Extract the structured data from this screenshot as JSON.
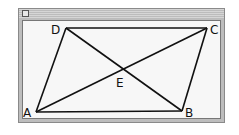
{
  "window": {
    "title": ""
  },
  "diagram": {
    "shape": "parallelogram",
    "vertices": {
      "A": {
        "label": "A",
        "x": 36,
        "y": 112
      },
      "B": {
        "label": "B",
        "x": 182,
        "y": 111
      },
      "C": {
        "label": "C",
        "x": 207,
        "y": 28
      },
      "D": {
        "label": "D",
        "x": 66,
        "y": 28
      }
    },
    "intersection": {
      "label": "E",
      "x": 121,
      "y": 69
    },
    "edges": [
      [
        "A",
        "B"
      ],
      [
        "B",
        "C"
      ],
      [
        "C",
        "D"
      ],
      [
        "D",
        "A"
      ]
    ],
    "diagonals": [
      [
        "A",
        "C"
      ],
      [
        "B",
        "D"
      ]
    ],
    "line_color": "#111111"
  }
}
